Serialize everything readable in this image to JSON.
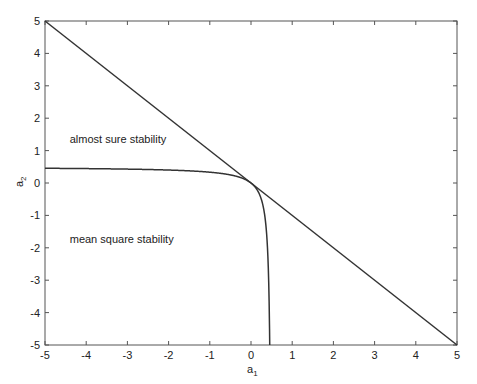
{
  "chart_data": {
    "type": "line",
    "title": "",
    "xlabel": "a",
    "xlabel_sub": "1",
    "ylabel": "a",
    "ylabel_sub": "2",
    "xlim": [
      -5,
      5
    ],
    "ylim": [
      -5,
      5
    ],
    "grid": false,
    "legend": null,
    "x_ticks": [
      -5,
      -4,
      -3,
      -2,
      -1,
      0,
      1,
      2,
      3,
      4,
      5
    ],
    "y_ticks": [
      -5,
      -4,
      -3,
      -2,
      -1,
      0,
      1,
      2,
      3,
      4,
      5
    ],
    "series": [
      {
        "name": "almost sure stability boundary",
        "description": "straight line a2 = -a1",
        "x": [
          -5,
          5
        ],
        "y": [
          5,
          -5
        ]
      },
      {
        "name": "mean square stability boundary",
        "description": "curve (0.5 - a1)(0.5 - a2) = 0.25",
        "x": [
          -5,
          -4,
          -3,
          -2,
          -1,
          -0.5,
          -0.25,
          0,
          0.1,
          0.2,
          0.3,
          0.35,
          0.4,
          0.42,
          0.44,
          0.455
        ],
        "y": [
          0.455,
          0.444,
          0.429,
          0.4,
          0.333,
          0.25,
          0.167,
          0,
          -0.125,
          -0.333,
          -0.75,
          -1.167,
          -2.0,
          -2.625,
          -3.667,
          -5.0
        ]
      }
    ],
    "annotations": [
      {
        "text": "almost sure stability",
        "x": -4.4,
        "y": 1.25
      },
      {
        "text": "mean square stability",
        "x": -4.4,
        "y": -1.85
      }
    ]
  },
  "labels": {
    "annotation_as": "almost sure stability",
    "annotation_ms": "mean square stability",
    "xlabel": "a",
    "xlabel_sub": "1",
    "ylabel": "a",
    "ylabel_sub": "2"
  }
}
